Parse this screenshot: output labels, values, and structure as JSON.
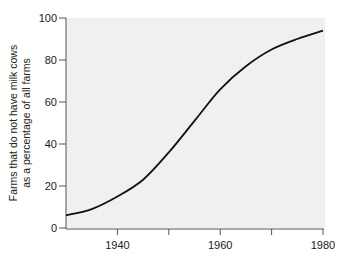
{
  "chart_data": {
    "type": "line",
    "title": "",
    "xlabel": "",
    "ylabel_lines": [
      "Farms that do not have milk cows",
      "as a percentage of all farms"
    ],
    "ylabel": "Farms that do not have milk cows as a percentage of all farms",
    "xlim": [
      1930,
      1980
    ],
    "ylim": [
      0,
      100
    ],
    "x_ticks": [
      1930,
      1940,
      1950,
      1960,
      1970,
      1980
    ],
    "x_tick_labels": [
      "",
      "1940",
      "",
      "1960",
      "",
      "1980"
    ],
    "y_ticks": [
      0,
      20,
      40,
      60,
      80,
      100
    ],
    "y_tick_labels": [
      "0",
      "20",
      "40",
      "60",
      "80",
      "100"
    ],
    "grid": false,
    "legend": null,
    "series": [
      {
        "name": "Farms without milk cows (%)",
        "x": [
          1930,
          1935,
          1940,
          1945,
          1950,
          1955,
          1960,
          1965,
          1970,
          1975,
          1980
        ],
        "values": [
          6,
          9,
          15,
          23,
          36,
          51,
          66,
          77,
          85,
          90,
          94
        ]
      }
    ]
  },
  "colors": {
    "plot_background": "#f0f0f0",
    "line": "#111111",
    "axis": "#555555"
  }
}
